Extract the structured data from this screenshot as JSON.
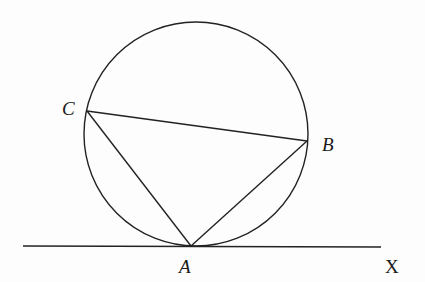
{
  "diagram": {
    "type": "geometry",
    "stroke_color": "#222222",
    "circle": {
      "cx": 196,
      "cy": 134,
      "r": 112
    },
    "points": {
      "A": {
        "x": 191,
        "y": 246,
        "label": "A"
      },
      "B": {
        "x": 307,
        "y": 141,
        "label": "B"
      },
      "C": {
        "x": 87,
        "y": 111,
        "label": "C"
      }
    },
    "segments": [
      {
        "from": "C",
        "to": "B"
      },
      {
        "from": "C",
        "to": "A"
      },
      {
        "from": "A",
        "to": "B"
      }
    ],
    "tangent_line": {
      "x1": 23,
      "y1": 246,
      "x2": 381,
      "y2": 247,
      "end_label": "X"
    }
  },
  "labels": {
    "A": "A",
    "B": "B",
    "C": "C",
    "X": "X"
  }
}
